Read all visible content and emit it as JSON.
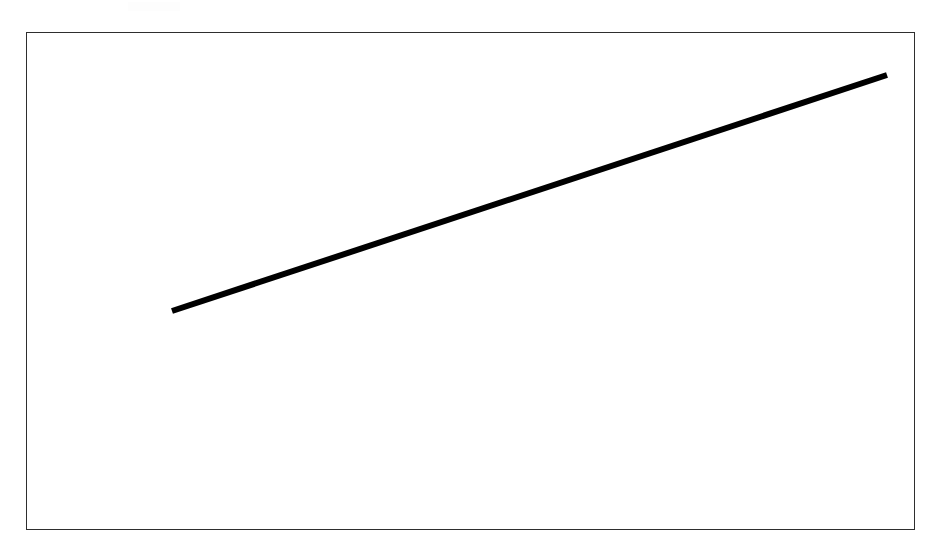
{
  "page": {
    "background_color": "#ffffff",
    "width": 945,
    "height": 558
  },
  "frame": {
    "name": "plot-border",
    "color": "#2e2e2e",
    "thickness_px": 1.6,
    "left": 26,
    "top": 32,
    "width": 889,
    "height": 498
  },
  "artifact": {
    "label": "faint scan artifact",
    "color": "#fdfdfd"
  },
  "chart_data": {
    "type": "line",
    "title": "",
    "subtitle": "",
    "xlabel": "",
    "ylabel": "",
    "grid": false,
    "legend": null,
    "annotations": [],
    "xticklabels": [],
    "yticklabels": [],
    "xlim": [
      0,
      100
    ],
    "ylim": [
      0,
      100
    ],
    "series": [
      {
        "name": "trend",
        "color": "#000000",
        "linewidth_px": 6,
        "x": [
          0,
          100
        ],
        "y": [
          0,
          100
        ],
        "pixel_points": [
          {
            "x": 172,
            "y": 311
          },
          {
            "x": 887,
            "y": 75
          }
        ]
      }
    ]
  }
}
